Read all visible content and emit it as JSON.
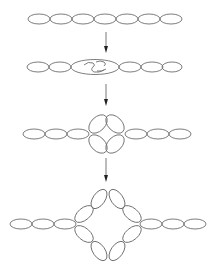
{
  "diagram": {
    "type": "process-stages",
    "stroke_color": "#6e6e6e",
    "arrow_color": "#222222",
    "stages": [
      {
        "id": 1,
        "label": "straight chain",
        "center_y": 19,
        "left_chain": {
          "start_x": 28,
          "count": 7,
          "width": 22,
          "height": 10
        },
        "center_feature": "none"
      },
      {
        "id": 2,
        "label": "central ellipse with inner S-fold",
        "center_y": 67,
        "left_chain": {
          "start_x": 27,
          "count": 2,
          "width": 22,
          "height": 10
        },
        "center_feature": "large-ellipse-with-folded-interior",
        "right_chain": {
          "start_x": 116,
          "count": 3,
          "width": 22,
          "height": 10
        }
      },
      {
        "id": 3,
        "label": "four-petal rosette",
        "center_y": 134,
        "left_chain": {
          "start_x": 23,
          "count": 3,
          "width": 22,
          "height": 10
        },
        "center_feature": "four-tilted-ellipses",
        "right_chain": {
          "start_x": 125,
          "count": 3,
          "width": 22,
          "height": 10
        }
      },
      {
        "id": 4,
        "label": "open diamond loop",
        "center_y": 224,
        "left_chain": {
          "start_x": 10,
          "count": 3,
          "width": 22,
          "height": 10
        },
        "center_feature": "eight-ellipse-diamond",
        "right_chain": {
          "start_x": 140,
          "count": 3,
          "width": 22,
          "height": 10
        }
      }
    ],
    "arrows": [
      {
        "from_stage": 1,
        "to_stage": 2,
        "x": 106,
        "y1": 32,
        "y2": 52
      },
      {
        "from_stage": 2,
        "to_stage": 3,
        "x": 106,
        "y1": 82,
        "y2": 106
      },
      {
        "from_stage": 3,
        "to_stage": 4,
        "x": 106,
        "y1": 157,
        "y2": 182
      }
    ]
  }
}
